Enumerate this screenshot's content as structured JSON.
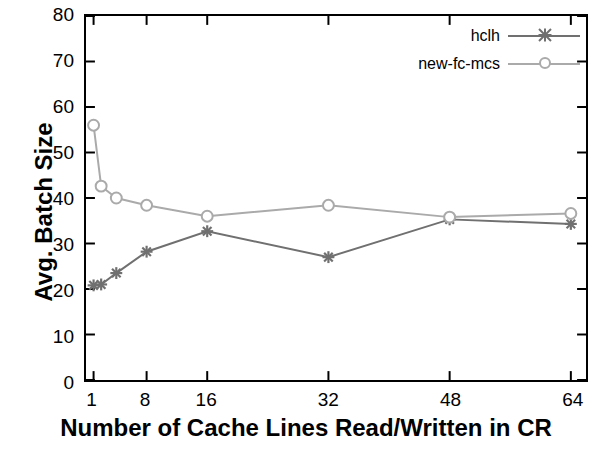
{
  "chart_data": {
    "type": "line",
    "title": "",
    "xlabel": "Number of Cache Lines Read/Written in CR",
    "ylabel": "Avg. Batch Size",
    "xlim": [
      0,
      66
    ],
    "ylim": [
      0,
      80
    ],
    "xticks": [
      1,
      8,
      16,
      32,
      48,
      64
    ],
    "xtick_labels": [
      "1",
      "8",
      "16",
      "32",
      "48",
      "64"
    ],
    "yticks": [
      0,
      10,
      20,
      30,
      40,
      50,
      60,
      70,
      80
    ],
    "ytick_labels": [
      "0",
      "10",
      "20",
      "30",
      "40",
      "50",
      "60",
      "70",
      "80"
    ],
    "grid": false,
    "legend_position": "top-right",
    "series": [
      {
        "name": "hclh",
        "color": "#707070",
        "marker": "star",
        "points": [
          {
            "x": 1,
            "y": 20.8
          },
          {
            "x": 2,
            "y": 21.0
          },
          {
            "x": 4,
            "y": 23.5
          },
          {
            "x": 8,
            "y": 28.2
          },
          {
            "x": 16,
            "y": 32.7
          },
          {
            "x": 32,
            "y": 27.0
          },
          {
            "x": 48,
            "y": 35.3
          },
          {
            "x": 64,
            "y": 34.3
          }
        ]
      },
      {
        "name": "new-fc-mcs",
        "color": "#aaaaaa",
        "marker": "circle",
        "points": [
          {
            "x": 1,
            "y": 56.0
          },
          {
            "x": 2,
            "y": 42.6
          },
          {
            "x": 4,
            "y": 40.0
          },
          {
            "x": 8,
            "y": 38.4
          },
          {
            "x": 16,
            "y": 36.0
          },
          {
            "x": 32,
            "y": 38.4
          },
          {
            "x": 48,
            "y": 35.8
          },
          {
            "x": 64,
            "y": 36.6
          }
        ]
      }
    ]
  },
  "legend": {
    "items": [
      {
        "label": "hclh"
      },
      {
        "label": "new-fc-mcs"
      }
    ]
  }
}
